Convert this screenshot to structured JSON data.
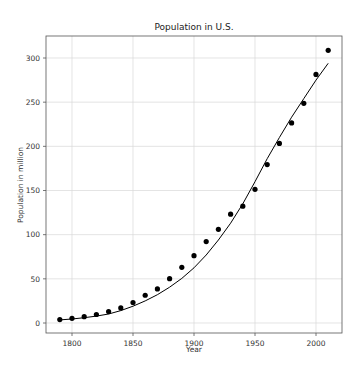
{
  "chart_data": {
    "type": "scatter",
    "title": "Population in U.S.",
    "xlabel": "Year",
    "ylabel": "Population in million",
    "xlim": [
      1780,
      2021
    ],
    "ylim": [
      -12,
      323
    ],
    "grid": true,
    "x_ticks": [
      1800,
      1850,
      1900,
      1950,
      2000
    ],
    "y_ticks": [
      0,
      50,
      100,
      150,
      200,
      250,
      300
    ],
    "series": [
      {
        "name": "Census data",
        "kind": "scatter",
        "color": "#000000",
        "x": [
          1790,
          1800,
          1810,
          1820,
          1830,
          1840,
          1850,
          1860,
          1870,
          1880,
          1890,
          1900,
          1910,
          1920,
          1930,
          1940,
          1950,
          1960,
          1970,
          1980,
          1990,
          2000,
          2010
        ],
        "values": [
          3.9,
          5.3,
          7.2,
          9.6,
          12.9,
          17.1,
          23.2,
          31.4,
          38.6,
          50.2,
          63.0,
          76.2,
          92.2,
          106.0,
          123.2,
          132.2,
          151.3,
          179.3,
          203.3,
          226.5,
          248.7,
          281.4,
          308.7
        ]
      },
      {
        "name": "Fitted model",
        "kind": "line",
        "color": "#000000",
        "x": [
          1790,
          1800,
          1810,
          1820,
          1830,
          1840,
          1850,
          1860,
          1870,
          1880,
          1890,
          1900,
          1910,
          1920,
          1930,
          1940,
          1950,
          1960,
          1970,
          1980,
          1990,
          2000,
          2010
        ],
        "values": [
          3.5,
          4.5,
          6.0,
          7.8,
          10.2,
          14.0,
          19.0,
          25.0,
          32.0,
          40.5,
          50.5,
          62.5,
          77.0,
          94.0,
          113.0,
          135.0,
          160.0,
          186.0,
          210.0,
          233.0,
          254.0,
          275.0,
          294.0
        ]
      }
    ]
  }
}
